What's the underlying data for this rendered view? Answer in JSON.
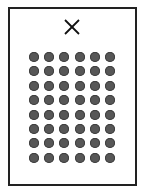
{
  "card": {
    "close_symbol": "X",
    "grid": {
      "columns": 6,
      "rows": 8,
      "dot_count": 48,
      "dot_color": "#575757"
    }
  },
  "colors": {
    "border": "#222222",
    "background": "#ffffff",
    "close_mark": "#111111"
  }
}
